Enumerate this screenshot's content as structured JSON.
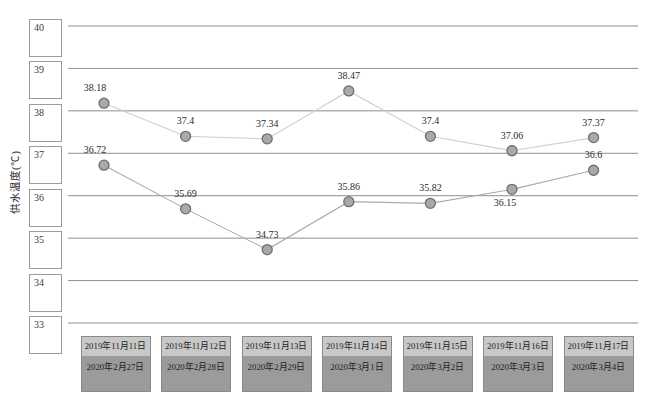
{
  "chart_data": {
    "type": "line",
    "title": "",
    "ylabel": "供水温度(℃)",
    "xlabel": "",
    "ylim": [
      33,
      40
    ],
    "yticks": [
      "40",
      "39",
      "38",
      "37",
      "36",
      "35",
      "34",
      "33"
    ],
    "grid": true,
    "legend": "none",
    "categories": [
      {
        "row1": "2019年11月11日",
        "row2": "2020年2月27日"
      },
      {
        "row1": "2019年11月12日",
        "row2": "2020年2月28日"
      },
      {
        "row1": "2019年11月13日",
        "row2": "2020年2月29日"
      },
      {
        "row1": "2019年11月14日",
        "row2": "2020年3月1日"
      },
      {
        "row1": "2019年11月15日",
        "row2": "2020年3月2日"
      },
      {
        "row1": "2019年11月16日",
        "row2": "2020年3月3日"
      },
      {
        "row1": "2019年11月17日",
        "row2": "2020年3月4日"
      }
    ],
    "series": [
      {
        "name": "2019",
        "values": [
          38.18,
          37.4,
          37.34,
          38.47,
          37.4,
          37.06,
          37.37
        ],
        "labels": [
          "38.18",
          "37.4",
          "37.34",
          "38.47",
          "37.4",
          "37.06",
          "37.37"
        ],
        "label_positions": [
          "above",
          "above",
          "above",
          "above",
          "above",
          "above",
          "above"
        ]
      },
      {
        "name": "2020",
        "values": [
          36.72,
          35.69,
          34.73,
          35.86,
          35.82,
          36.15,
          36.6
        ],
        "labels": [
          "36.72",
          "35.69",
          "34.73",
          "35.86",
          "35.82",
          "36.15",
          "36.6"
        ],
        "label_positions": [
          "above",
          "above",
          "above",
          "above",
          "above",
          "below",
          "above"
        ]
      }
    ],
    "colors": {
      "gridline": "#8f8f8f",
      "series_2019_line": "#cfcfcf",
      "series_2020_line": "#ababab",
      "marker_fill": "#a9a9a9",
      "marker_stroke": "#6e6e6e",
      "tick_box_bg": "#ffffff",
      "tick_box_border": "#9c9c9c",
      "category_box_border": "#8a8a8a",
      "category_row1_bg": "#c8c8c8",
      "category_row2_bg": "#9b9b9b",
      "label_text": "#2b2b2b"
    }
  }
}
